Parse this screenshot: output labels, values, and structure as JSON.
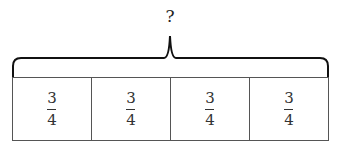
{
  "diagram": {
    "question_label": "?",
    "parts": [
      {
        "numerator": "3",
        "denominator": "4"
      },
      {
        "numerator": "3",
        "denominator": "4"
      },
      {
        "numerator": "3",
        "denominator": "4"
      },
      {
        "numerator": "3",
        "denominator": "4"
      }
    ]
  }
}
